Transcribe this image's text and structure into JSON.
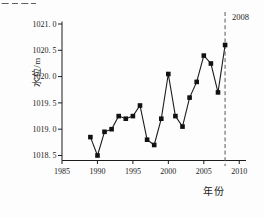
{
  "page": {
    "background": "#fdfdfd",
    "ink_color": "#1c1c1c"
  },
  "artifacts": {
    "top_left_clipped_text": true
  },
  "chart_data": {
    "type": "line",
    "title": "",
    "ylabel": "水位/m",
    "xlabel": "年份",
    "x": [
      1989,
      1990,
      1991,
      1992,
      1993,
      1994,
      1995,
      1996,
      1997,
      1998,
      1999,
      2000,
      2001,
      2002,
      2003,
      2004,
      2005,
      2006,
      2007,
      2008
    ],
    "values": [
      1018.85,
      1018.5,
      1018.95,
      1019.0,
      1019.25,
      1019.2,
      1019.25,
      1019.45,
      1018.8,
      1018.7,
      1019.2,
      1020.05,
      1019.25,
      1019.05,
      1019.6,
      1019.9,
      1020.4,
      1020.25,
      1019.7,
      1020.6
    ],
    "xlim": [
      1985,
      2010
    ],
    "ylim": [
      1018.3,
      1021.0
    ],
    "xticks": [
      1985,
      1990,
      1995,
      2000,
      2005,
      2010
    ],
    "xtick_labels": [
      "1985",
      "1990",
      "1995",
      "2000",
      "2005",
      "2010"
    ],
    "yticks": [
      1021.0,
      1020.5,
      1020.0,
      1019.5,
      1019.0,
      1018.5
    ],
    "ytick_labels": [
      "1021. 0",
      "1020. 5",
      "1020. 0",
      "1019. 5",
      "1019. 0",
      "1018. 5"
    ],
    "annotation": {
      "label": "2008",
      "year": 2008,
      "style": "dashed-vertical-line",
      "line_color": "#555555"
    },
    "marker": "filled-square",
    "line_color": "#1c1c1c",
    "marker_color": "#111111",
    "grid": false,
    "legend": "none"
  }
}
